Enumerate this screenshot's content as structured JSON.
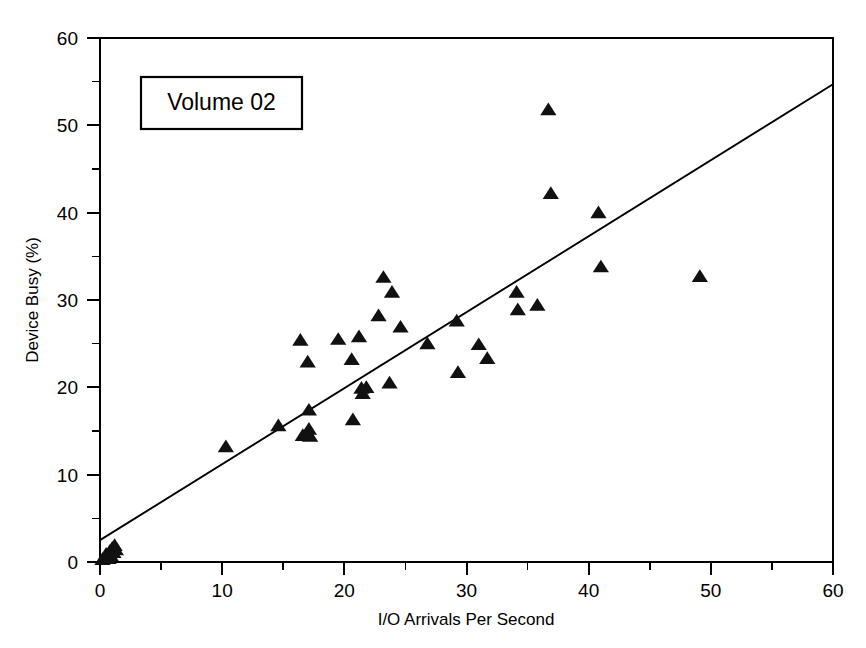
{
  "chart_data": {
    "type": "scatter",
    "title": "",
    "annotation": "Volume 02",
    "xlabel": "I/O Arrivals Per Second",
    "ylabel": "Device Busy (%)",
    "xlim": [
      0,
      60
    ],
    "ylim": [
      0,
      60
    ],
    "x_ticks": [
      0,
      10,
      20,
      30,
      40,
      50,
      60
    ],
    "y_ticks": [
      0,
      10,
      20,
      30,
      40,
      50,
      60
    ],
    "x_tick_labels": [
      "0",
      "10",
      "20",
      "30",
      "40",
      "50",
      "60"
    ],
    "y_tick_labels": [
      "0",
      "10",
      "20",
      "30",
      "40",
      "50",
      "60"
    ],
    "x_minor_ticks": [
      5,
      15,
      25,
      35,
      45,
      55
    ],
    "y_minor_ticks": [
      5,
      15,
      25,
      35,
      45,
      55
    ],
    "grid": false,
    "legend": false,
    "marker": "triangle-up",
    "marker_color": "#111111",
    "series": [
      {
        "name": "Volume 02",
        "points": [
          [
            0.2,
            0.3
          ],
          [
            0.4,
            0.5
          ],
          [
            0.5,
            0.9
          ],
          [
            0.7,
            0.4
          ],
          [
            0.8,
            1.2
          ],
          [
            0.9,
            0.7
          ],
          [
            1.0,
            1.6
          ],
          [
            1.1,
            1.1
          ],
          [
            1.2,
            1.9
          ],
          [
            1.3,
            1.4
          ],
          [
            10.3,
            13.2
          ],
          [
            14.6,
            15.6
          ],
          [
            16.4,
            25.4
          ],
          [
            16.6,
            14.5
          ],
          [
            17.0,
            22.9
          ],
          [
            17.1,
            17.4
          ],
          [
            17.1,
            15.2
          ],
          [
            17.2,
            14.4
          ],
          [
            19.5,
            25.5
          ],
          [
            20.6,
            23.2
          ],
          [
            20.7,
            16.3
          ],
          [
            21.2,
            25.8
          ],
          [
            21.4,
            19.9
          ],
          [
            21.5,
            19.3
          ],
          [
            21.8,
            20.0
          ],
          [
            22.8,
            28.2
          ],
          [
            23.2,
            32.6
          ],
          [
            23.7,
            20.5
          ],
          [
            23.9,
            30.9
          ],
          [
            24.6,
            26.9
          ],
          [
            26.8,
            25.0
          ],
          [
            29.2,
            27.6
          ],
          [
            29.3,
            21.7
          ],
          [
            31.0,
            24.9
          ],
          [
            31.7,
            23.3
          ],
          [
            34.1,
            30.9
          ],
          [
            34.2,
            28.9
          ],
          [
            35.8,
            29.4
          ],
          [
            36.7,
            51.8
          ],
          [
            36.9,
            42.2
          ],
          [
            40.8,
            40.0
          ],
          [
            41.0,
            33.8
          ],
          [
            49.1,
            32.7
          ]
        ]
      }
    ],
    "trend_line": {
      "name": "linear-fit",
      "x_start": 0,
      "y_start": 2.5,
      "x_end": 60,
      "y_end": 54.7,
      "slope": 0.87,
      "intercept": 2.5
    }
  }
}
